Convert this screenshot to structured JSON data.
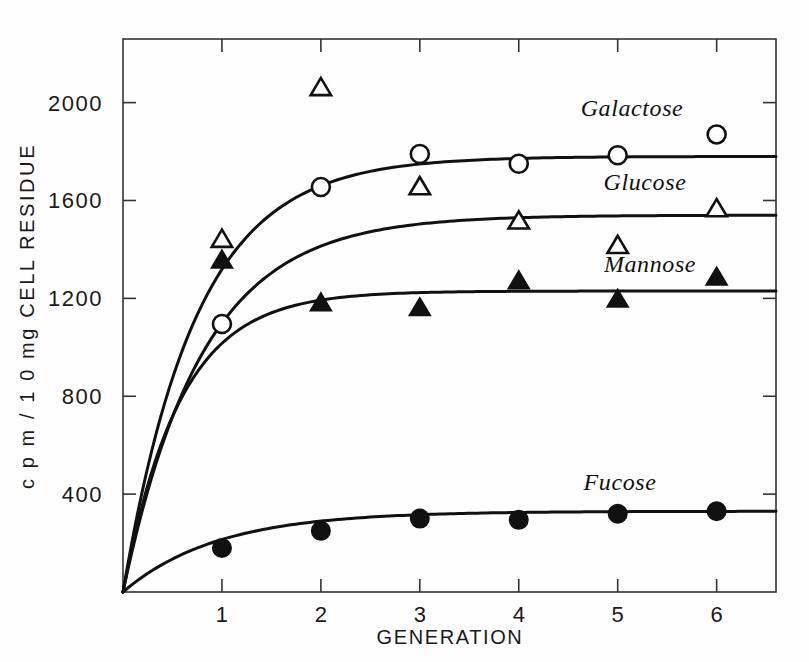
{
  "chart_data": {
    "type": "line",
    "title": "",
    "xlabel": "GENERATION",
    "ylabel": "c p m / 1 0 mg  CELL RESIDUE",
    "x": [
      1,
      2,
      3,
      4,
      5,
      6
    ],
    "xlim": [
      0,
      6.6
    ],
    "ylim": [
      0,
      2260
    ],
    "xticks": [
      "1",
      "2",
      "3",
      "4",
      "5",
      "6"
    ],
    "yticks": [
      "400",
      "800",
      "1200",
      "1600",
      "2000"
    ],
    "ytick_values": [
      400,
      800,
      1200,
      1600,
      2000
    ],
    "grid": false,
    "legend_position": "inline-right",
    "series": [
      {
        "name": "Galactose",
        "marker": "open-circle",
        "values": [
          1095,
          1655,
          1790,
          1750,
          1785,
          1870
        ],
        "plateau": 1780
      },
      {
        "name": "Glucose",
        "marker": "open-triangle",
        "values": [
          1440,
          2060,
          1655,
          1515,
          1415,
          1565
        ],
        "plateau": 1540
      },
      {
        "name": "Mannose",
        "marker": "filled-triangle",
        "values": [
          1355,
          1180,
          1160,
          1270,
          1195,
          1285
        ],
        "plateau": 1230
      },
      {
        "name": "Fucose",
        "marker": "filled-circle",
        "values": [
          180,
          250,
          300,
          295,
          320,
          330
        ],
        "plateau": 330
      }
    ]
  },
  "axes": {
    "x_axis_title": "GENERATION",
    "y_axis_title": "c p m / 1 0 mg  CELL RESIDUE"
  },
  "labels": {
    "galactose": "Galactose",
    "glucose": "Glucose",
    "mannose": "Mannose",
    "fucose": "Fucose"
  },
  "colors": {
    "ink": "#111111",
    "axis": "#333333",
    "background": "#ffffff"
  }
}
